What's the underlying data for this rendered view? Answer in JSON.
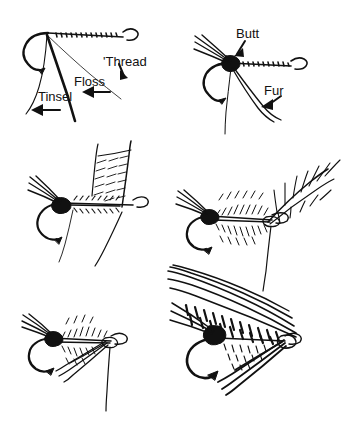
{
  "figure": {
    "background_color": "#ffffff",
    "ink_color": "#111111",
    "width": 343,
    "height": 440,
    "grid": {
      "columns": 2,
      "rows": 3
    }
  },
  "panels": [
    {
      "id": "panel-1",
      "position": "top-left",
      "caption": "Hook with tying thread, floss and tinsel hanging from shank",
      "labels": [
        {
          "name": "thread",
          "text": "'Thread",
          "x": 103,
          "y": 61
        },
        {
          "name": "floss",
          "text": "Floss",
          "x": 72,
          "y": 83
        },
        {
          "name": "tinsel",
          "text": "Tinsel",
          "x": 36,
          "y": 98
        }
      ],
      "arrows": [
        {
          "name": "thread-arrow",
          "from": [
            118,
            66
          ],
          "to": [
            125,
            80
          ]
        },
        {
          "name": "floss-arrow",
          "from": [
            110,
            93
          ],
          "to": [
            85,
            93
          ]
        },
        {
          "name": "tinsel-arrow",
          "from": [
            60,
            110
          ],
          "to": [
            33,
            110
          ]
        }
      ]
    },
    {
      "id": "panel-2",
      "position": "top-right",
      "caption": "Butt of black chenille and fur body tied in at the tail",
      "labels": [
        {
          "name": "butt",
          "text": "Butt",
          "x": 237,
          "y": 36
        },
        {
          "name": "fur",
          "text": "Fur",
          "x": 263,
          "y": 92
        }
      ],
      "arrows": [
        {
          "name": "butt-arrow",
          "from": [
            244,
            41
          ],
          "to": [
            234,
            56
          ]
        },
        {
          "name": "fur-arrow",
          "from": [
            281,
            97
          ],
          "to": [
            262,
            110
          ]
        }
      ]
    },
    {
      "id": "panel-3",
      "position": "middle-left",
      "caption": "Feather wing slip held upright over the dubbed body",
      "labels": [],
      "arrows": []
    },
    {
      "id": "panel-4",
      "position": "middle-right",
      "caption": "Hackle feather tied in at the eye with dubbed body brushed out",
      "labels": [],
      "arrows": []
    },
    {
      "id": "panel-5",
      "position": "bottom-left",
      "caption": "Hackle wound and swept back, thread still hanging",
      "labels": [],
      "arrows": []
    },
    {
      "id": "panel-6",
      "position": "bottom-right",
      "caption": "Finished wet fly with barred mottled wing over the body",
      "labels": [],
      "arrows": []
    }
  ]
}
